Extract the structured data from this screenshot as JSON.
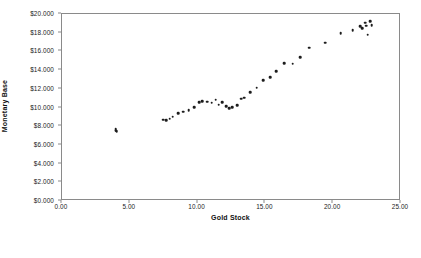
{
  "chart_data": {
    "type": "scatter",
    "title": "",
    "xlabel": "Gold Stock",
    "ylabel": "Monetary Base",
    "xlim": [
      0.0,
      25.0
    ],
    "ylim": [
      0,
      20000
    ],
    "grid": false,
    "legend": null,
    "x_ticks": [
      0.0,
      5.0,
      10.0,
      15.0,
      20.0,
      25.0
    ],
    "x_tick_labels": [
      "0.00",
      "5.00",
      "10.00",
      "15.00",
      "20.00",
      "25.00"
    ],
    "y_ticks": [
      0,
      2000,
      4000,
      6000,
      8000,
      10000,
      12000,
      14000,
      16000,
      18000,
      20000
    ],
    "y_tick_labels": [
      "$0.000",
      "$2.000",
      "$4.000",
      "$6.000",
      "$8.000",
      "$10.000",
      "$12.000",
      "$14.000",
      "$16.000",
      "$18.000",
      "$20.000"
    ],
    "marker": "circle",
    "marker_color": "#1c1c1c",
    "points": [
      {
        "x": 3.95,
        "y": 7750
      },
      {
        "x": 3.97,
        "y": 7600
      },
      {
        "x": 4.0,
        "y": 7500
      },
      {
        "x": 4.02,
        "y": 7420
      },
      {
        "x": 7.45,
        "y": 8680
      },
      {
        "x": 7.7,
        "y": 8620
      },
      {
        "x": 7.95,
        "y": 8800
      },
      {
        "x": 8.15,
        "y": 9000
      },
      {
        "x": 8.55,
        "y": 9400
      },
      {
        "x": 8.95,
        "y": 9550
      },
      {
        "x": 9.35,
        "y": 9700
      },
      {
        "x": 9.75,
        "y": 10050
      },
      {
        "x": 10.1,
        "y": 10550
      },
      {
        "x": 10.35,
        "y": 10700
      },
      {
        "x": 10.7,
        "y": 10600
      },
      {
        "x": 11.05,
        "y": 10500
      },
      {
        "x": 11.35,
        "y": 10850
      },
      {
        "x": 11.55,
        "y": 10300
      },
      {
        "x": 11.8,
        "y": 10550
      },
      {
        "x": 12.1,
        "y": 10150
      },
      {
        "x": 12.35,
        "y": 9950
      },
      {
        "x": 12.55,
        "y": 10050
      },
      {
        "x": 12.9,
        "y": 10250
      },
      {
        "x": 13.2,
        "y": 10950
      },
      {
        "x": 13.45,
        "y": 11050
      },
      {
        "x": 13.9,
        "y": 11650
      },
      {
        "x": 14.35,
        "y": 12100
      },
      {
        "x": 14.85,
        "y": 12950
      },
      {
        "x": 15.35,
        "y": 13250
      },
      {
        "x": 15.8,
        "y": 13900
      },
      {
        "x": 16.4,
        "y": 14750
      },
      {
        "x": 17.0,
        "y": 14700
      },
      {
        "x": 17.55,
        "y": 15400
      },
      {
        "x": 18.25,
        "y": 16400
      },
      {
        "x": 19.4,
        "y": 16950
      },
      {
        "x": 20.55,
        "y": 17950
      },
      {
        "x": 21.45,
        "y": 18250
      },
      {
        "x": 22.0,
        "y": 18700
      },
      {
        "x": 22.15,
        "y": 18450
      },
      {
        "x": 22.35,
        "y": 19050
      },
      {
        "x": 22.45,
        "y": 18750
      },
      {
        "x": 22.55,
        "y": 17800
      },
      {
        "x": 22.75,
        "y": 19200
      },
      {
        "x": 22.85,
        "y": 18800
      }
    ]
  }
}
